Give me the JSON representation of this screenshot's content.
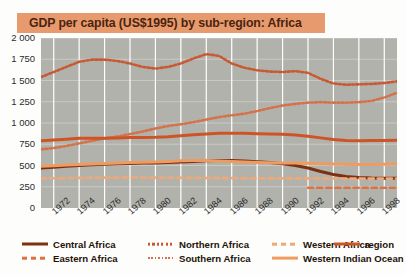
{
  "title": "GDP per capita (US$1995) by sub-region: Africa",
  "colors": {
    "banner": "#e79a6d",
    "title_text": "#4a2410",
    "plot_background": "#b2b2ac",
    "gridline_vertical": "#ffffff",
    "gridline_horizontal": "#c9c9c3",
    "central_africa": "#7d3113",
    "eastern_africa": "#e0713f",
    "northern_africa": "#c75a33",
    "southern_africa": "#d4724a",
    "western_africa": "#efa878",
    "western_indian_ocean": "#ef9a5e",
    "region": "#cf5425"
  },
  "legend": {
    "items": [
      {
        "label": "Central Africa",
        "style": "solid",
        "color": "#7d3113",
        "width": 3,
        "col": 0,
        "row": 0
      },
      {
        "label": "Eastern Africa",
        "style": "dashed",
        "color": "#e0713f",
        "width": 2.6,
        "col": 0,
        "row": 1
      },
      {
        "label": "Northern Africa",
        "style": "dotted",
        "color": "#c75a33",
        "width": 2.6,
        "col": 1,
        "row": 0
      },
      {
        "label": "Southern Africa",
        "style": "dotted",
        "color": "#d4724a",
        "width": 2,
        "col": 1,
        "row": 1
      },
      {
        "label": "Western Africa",
        "style": "dashed",
        "color": "#efa878",
        "width": 2.6,
        "col": 2,
        "row": 0
      },
      {
        "label": "Western Indian Ocean",
        "style": "solid",
        "color": "#ef9a5e",
        "width": 2.8,
        "col": 2,
        "row": 1
      },
      {
        "label": "region",
        "style": "solid",
        "color": "#cf5425",
        "width": 3,
        "col": 3,
        "row": 0
      }
    ]
  },
  "chart_data": {
    "type": "line",
    "title": "GDP per capita (US$1995) by sub-region: Africa",
    "xlabel": "",
    "ylabel": "",
    "ylim": [
      0,
      2000
    ],
    "ytick_step": 250,
    "ytick_labels": [
      "0",
      "250",
      "500",
      "750",
      "1 000",
      "1 250",
      "1 500",
      "1 750",
      "2 000"
    ],
    "ytick_values": [
      0,
      250,
      500,
      750,
      1000,
      1250,
      1500,
      1750,
      2000
    ],
    "xlim": [
      1971,
      1999
    ],
    "xtick_labels": [
      "1972",
      "1974",
      "1976",
      "1978",
      "1980",
      "1982",
      "1984",
      "1986",
      "1988",
      "1990",
      "1992",
      "1994",
      "1996",
      "1998"
    ],
    "xtick_values": [
      1972,
      1974,
      1976,
      1978,
      1980,
      1982,
      1984,
      1986,
      1988,
      1990,
      1992,
      1994,
      1996,
      1998
    ],
    "grid": true,
    "legend_position": "bottom",
    "x": [
      1971,
      1972,
      1973,
      1974,
      1975,
      1976,
      1977,
      1978,
      1979,
      1980,
      1981,
      1982,
      1983,
      1984,
      1985,
      1986,
      1987,
      1988,
      1989,
      1990,
      1991,
      1992,
      1993,
      1994,
      1995,
      1996,
      1997,
      1998,
      1999
    ],
    "series": [
      {
        "name": "Northern Africa",
        "style": "dotted",
        "color": "#c75a33",
        "values": [
          1540,
          1600,
          1660,
          1720,
          1745,
          1745,
          1730,
          1700,
          1660,
          1640,
          1660,
          1700,
          1760,
          1810,
          1790,
          1700,
          1650,
          1620,
          1605,
          1600,
          1610,
          1590,
          1520,
          1465,
          1450,
          1455,
          1460,
          1470,
          1490
        ]
      },
      {
        "name": "Southern Africa",
        "style": "dotted",
        "color": "#d4724a",
        "values": [
          690,
          705,
          730,
          760,
          790,
          820,
          840,
          870,
          900,
          935,
          965,
          985,
          1010,
          1040,
          1070,
          1090,
          1110,
          1140,
          1175,
          1205,
          1225,
          1240,
          1245,
          1240,
          1240,
          1245,
          1260,
          1300,
          1355
        ]
      },
      {
        "name": "region",
        "style": "solid",
        "color": "#cf5425",
        "values": [
          790,
          800,
          810,
          820,
          820,
          822,
          825,
          828,
          830,
          832,
          838,
          850,
          862,
          872,
          878,
          880,
          878,
          875,
          872,
          868,
          860,
          845,
          825,
          805,
          795,
          792,
          793,
          795,
          798
        ]
      },
      {
        "name": "Central Africa",
        "style": "solid",
        "color": "#7d3113",
        "values": [
          470,
          478,
          490,
          500,
          508,
          515,
          520,
          524,
          528,
          530,
          534,
          540,
          548,
          556,
          560,
          558,
          552,
          545,
          535,
          520,
          500,
          470,
          430,
          395,
          370,
          358,
          352,
          350,
          350
        ]
      },
      {
        "name": "Western Indian Ocean",
        "style": "solid",
        "color": "#ef9a5e",
        "values": [
          490,
          497,
          505,
          512,
          518,
          524,
          530,
          534,
          538,
          542,
          548,
          556,
          560,
          558,
          552,
          546,
          540,
          536,
          532,
          530,
          528,
          526,
          522,
          518,
          514,
          512,
          512,
          514,
          518
        ]
      },
      {
        "name": "Western Africa",
        "style": "dashed",
        "color": "#efa878",
        "values": [
          348,
          350,
          352,
          354,
          356,
          357,
          358,
          358,
          358,
          357,
          356,
          355,
          354,
          353,
          352,
          351,
          350,
          350,
          349,
          349,
          348,
          348,
          347,
          347,
          346,
          346,
          346,
          346,
          346
        ]
      },
      {
        "name": "Eastern Africa",
        "style": "dashed",
        "color": "#e0713f",
        "values": [
          null,
          null,
          null,
          null,
          null,
          null,
          null,
          null,
          null,
          null,
          null,
          null,
          null,
          null,
          null,
          null,
          null,
          null,
          null,
          null,
          null,
          238,
          238,
          238,
          238,
          238,
          238,
          238,
          238
        ]
      }
    ]
  }
}
